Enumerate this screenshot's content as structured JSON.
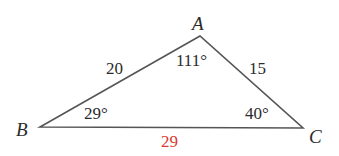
{
  "diagram": {
    "type": "triangle",
    "vertices": {
      "A": {
        "label": "A",
        "x": 200,
        "y": 36
      },
      "B": {
        "label": "B",
        "x": 40,
        "y": 127
      },
      "C": {
        "label": "C",
        "x": 303,
        "y": 128
      }
    },
    "sides": {
      "AB": "20",
      "AC": "15",
      "BC": "29"
    },
    "angles": {
      "A": "111°",
      "B": "29°",
      "C": "40°"
    },
    "colors": {
      "line": "#555555",
      "text": "#2b2b2b",
      "highlight": "#d9392f"
    }
  }
}
